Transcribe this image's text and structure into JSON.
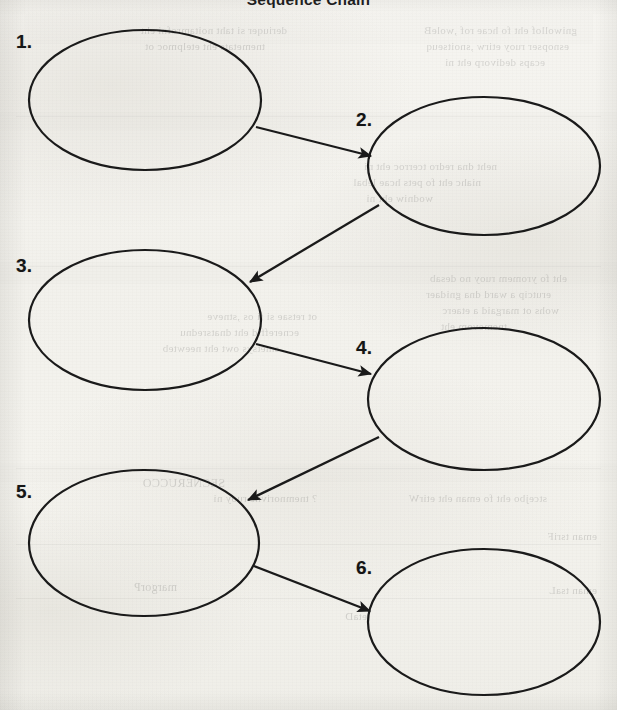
{
  "document": {
    "title": "Sequence Chain",
    "paper_color": "#f4f3ef",
    "ink_color": "#1a1a1a"
  },
  "chart_data": {
    "type": "diagram",
    "diagram_kind": "sequence-chain-graphic-organizer",
    "title": "Sequence Chain",
    "node_count": 6,
    "nodes": [
      {
        "id": "node-1",
        "label": "1.",
        "text": "",
        "cx": 145,
        "cy": 100,
        "rx": 116,
        "ry": 70,
        "label_x": 16,
        "label_y": 32
      },
      {
        "id": "node-2",
        "label": "2.",
        "text": "",
        "cx": 484,
        "cy": 166,
        "rx": 116,
        "ry": 69,
        "label_x": 356,
        "label_y": 110
      },
      {
        "id": "node-3",
        "label": "3.",
        "text": "",
        "cx": 145,
        "cy": 320,
        "rx": 116,
        "ry": 70,
        "label_x": 16,
        "label_y": 256
      },
      {
        "id": "node-4",
        "label": "4.",
        "text": "",
        "cx": 484,
        "cy": 399,
        "rx": 116,
        "ry": 71,
        "label_x": 356,
        "label_y": 338
      },
      {
        "id": "node-5",
        "label": "5.",
        "text": "",
        "cx": 144,
        "cy": 543,
        "rx": 115,
        "ry": 73,
        "label_x": 16,
        "label_y": 482
      },
      {
        "id": "node-6",
        "label": "6.",
        "text": "",
        "cx": 484,
        "cy": 622,
        "rx": 116,
        "ry": 73,
        "label_x": 356,
        "label_y": 558
      }
    ],
    "edges": [
      {
        "id": "edge-1-2",
        "from": "node-1",
        "to": "node-2",
        "x1": 256,
        "y1": 127,
        "x2": 371,
        "y2": 156,
        "arrowhead": "filled-triangle"
      },
      {
        "id": "edge-2-3",
        "from": "node-2",
        "to": "node-3",
        "x1": 379,
        "y1": 205,
        "x2": 250,
        "y2": 282,
        "arrowhead": "filled-triangle"
      },
      {
        "id": "edge-3-4",
        "from": "node-3",
        "to": "node-4",
        "x1": 256,
        "y1": 344,
        "x2": 371,
        "y2": 374,
        "arrowhead": "filled-triangle"
      },
      {
        "id": "edge-4-5",
        "from": "node-4",
        "to": "node-5",
        "x1": 379,
        "y1": 437,
        "x2": 248,
        "y2": 500,
        "arrowhead": "filled-triangle"
      },
      {
        "id": "edge-5-6",
        "from": "node-5",
        "to": "node-6",
        "x1": 254,
        "y1": 566,
        "x2": 370,
        "y2": 611,
        "arrowhead": "filled-triangle"
      }
    ],
    "grid": false,
    "legend": null,
    "axes": null
  },
  "bleed_through": {
    "note": "Faint mirrored text showing through from the reverse side of the scanned page; not legible content.",
    "lines": [
      {
        "text": "gniwollof eht fo hcae rof ,woleB",
        "x": 40,
        "y": 24,
        "size": 11
      },
      {
        "text": "esnopser ruoy etirw ,snoitseuq",
        "x": 48,
        "y": 40,
        "size": 11
      },
      {
        "text": "ecaps dedivorp eht ni",
        "x": 72,
        "y": 56,
        "size": 11
      },
      {
        "text": "deriuqer si taht noitamrofni eht",
        "x": 330,
        "y": 24,
        "size": 11
      },
      {
        "text": "tnemetats eht etelpmoc ot",
        "x": 352,
        "y": 40,
        "size": 11
      },
      {
        "text": "neht dna redro tcerroc eht ni",
        "x": 120,
        "y": 160,
        "size": 11
      },
      {
        "text": "niahc eht fo pets hcae lebal",
        "x": 136,
        "y": 176,
        "size": 11
      },
      {
        "text": "wodniw eht ni",
        "x": 184,
        "y": 192,
        "size": 11
      },
      {
        "text": "eht fo yromem ruoy no desab",
        "x": 50,
        "y": 272,
        "size": 11
      },
      {
        "text": "erutcip a ward dna gnidaer",
        "x": 66,
        "y": 288,
        "size": 11
      },
      {
        "text": "wohs ot margaid a etaerc",
        "x": 58,
        "y": 304,
        "size": 11
      },
      {
        "text": "tnemevom eht",
        "x": 110,
        "y": 320,
        "size": 11
      },
      {
        "text": "ot retsae si ti os ,stneve",
        "x": 300,
        "y": 310,
        "size": 11
      },
      {
        "text": "ecnereffid eht dnatsrednu",
        "x": 318,
        "y": 326,
        "size": 11
      },
      {
        "text": "smetsys owt eht neewteb",
        "x": 338,
        "y": 342,
        "size": 11
      },
      {
        "text": "SECNERUCCO",
        "x": 392,
        "y": 476,
        "size": 12
      },
      {
        "text": "stcejbo eht fo eman eht etirW",
        "x": 70,
        "y": 492,
        "size": 11
      },
      {
        "text": "? tnemnorivne ruoy ni",
        "x": 300,
        "y": 492,
        "size": 11
      },
      {
        "text": "eman tsriF",
        "x": 20,
        "y": 530,
        "size": 11
      },
      {
        "text": "eman tsaL",
        "x": 20,
        "y": 584,
        "size": 11
      },
      {
        "text": "margorP",
        "x": 440,
        "y": 580,
        "size": 12
      },
      {
        "text": "etaD",
        "x": 250,
        "y": 610,
        "size": 11
      }
    ],
    "bands": [
      {
        "x": 24,
        "y": 14,
        "w": 568,
        "h": 30
      },
      {
        "x": 0,
        "y": 112,
        "w": 617,
        "h": 18
      },
      {
        "x": 0,
        "y": 262,
        "w": 617,
        "h": 22
      },
      {
        "x": 0,
        "y": 464,
        "w": 617,
        "h": 18
      }
    ],
    "rules": [
      {
        "x": 16,
        "y": 116,
        "w": 585
      },
      {
        "x": 16,
        "y": 266,
        "w": 585
      },
      {
        "x": 16,
        "y": 468,
        "w": 585
      },
      {
        "x": 16,
        "y": 544,
        "w": 585
      },
      {
        "x": 16,
        "y": 598,
        "w": 585
      }
    ]
  }
}
